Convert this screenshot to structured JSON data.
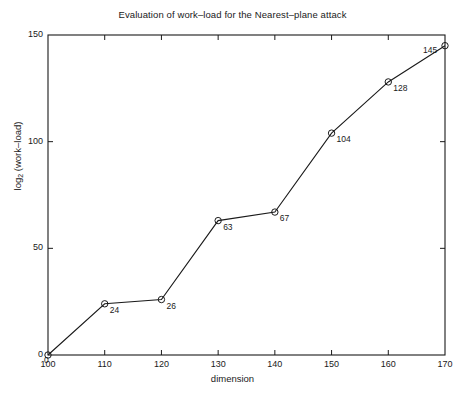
{
  "chart_data": {
    "type": "line",
    "title": "Evaluation of work–load for the Nearest–plane attack",
    "xlabel": "dimension",
    "ylabel": "log_2 (work–load)",
    "ylabel_base": "log",
    "ylabel_sub": "2",
    "ylabel_rest": " (work–load)",
    "x": [
      100,
      110,
      120,
      130,
      140,
      150,
      160,
      170
    ],
    "values": [
      0,
      24,
      26,
      63,
      67,
      104,
      128,
      145
    ],
    "point_labels": [
      "0",
      "24",
      "26",
      "63",
      "67",
      "104",
      "128",
      "145"
    ],
    "xlim": [
      100,
      170
    ],
    "ylim": [
      0,
      150
    ],
    "xticks": [
      100,
      110,
      120,
      130,
      140,
      150,
      160,
      170
    ],
    "xtick_labels": [
      "100",
      "110",
      "120",
      "130",
      "140",
      "150",
      "160",
      "170"
    ],
    "yticks": [
      0,
      50,
      100,
      150
    ],
    "ytick_labels": [
      "0",
      "50",
      "100",
      "150"
    ],
    "grid": false,
    "legend": false,
    "marker": "open-circle",
    "line_color": "#1a1a1a",
    "marker_color": "#1a1a1a",
    "background_color": "#ffffff",
    "axis_color": "#1a1a1a"
  }
}
